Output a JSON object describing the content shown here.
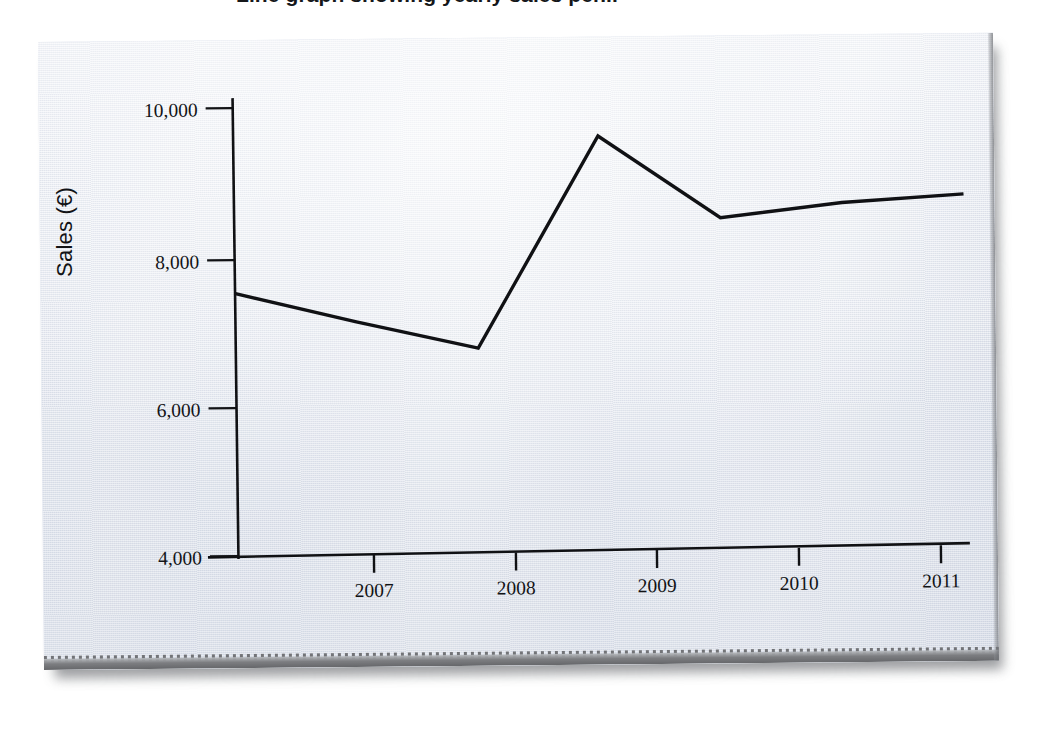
{
  "figure": {
    "title_cropped": "Line graph showing yearly sales per...",
    "medium": "photograph of a printed page",
    "paper_color": "#e9ecf3",
    "ink_color": "#101114",
    "background_color": "#ffffff"
  },
  "chart_data": {
    "type": "line",
    "title": "",
    "xlabel": "",
    "ylabel": "Sales (€)",
    "categories": [
      "2006",
      "2007",
      "2008",
      "2009",
      "2010",
      "2011",
      "2012"
    ],
    "x": [
      2006,
      2007,
      2008,
      2009,
      2010,
      2011,
      2012
    ],
    "values": [
      7550,
      7150,
      6780,
      9630,
      8510,
      8700,
      8800
    ],
    "series": [
      {
        "name": "Sales",
        "values": [
          7550,
          7150,
          6780,
          9630,
          8510,
          8700,
          8800
        ]
      }
    ],
    "x_tick_labels": [
      "2007",
      "2008",
      "2009",
      "2010",
      "2011"
    ],
    "y_tick_labels": [
      "4,000",
      "6,000",
      "8,000",
      "10,000"
    ],
    "y_tick_values": [
      4000,
      6000,
      8000,
      10000
    ],
    "ylim": [
      4000,
      10400
    ],
    "xlim": [
      2006,
      2012
    ],
    "grid": false,
    "legend": false,
    "legend_position": "none",
    "line_color": "#101114",
    "markers": false,
    "annotations": []
  },
  "axes": {
    "y_title": "Sales (€)",
    "y_ticks": [
      {
        "label": "10,000",
        "value": 10000
      },
      {
        "label": "8,000",
        "value": 8000
      },
      {
        "label": "6,000",
        "value": 6000
      },
      {
        "label": "4,000",
        "value": 4000
      }
    ],
    "x_ticks": [
      {
        "label": "2007",
        "value": 2007
      },
      {
        "label": "2008",
        "value": 2008
      },
      {
        "label": "2009",
        "value": 2009
      },
      {
        "label": "2010",
        "value": 2010
      },
      {
        "label": "2011",
        "value": 2011
      }
    ]
  }
}
